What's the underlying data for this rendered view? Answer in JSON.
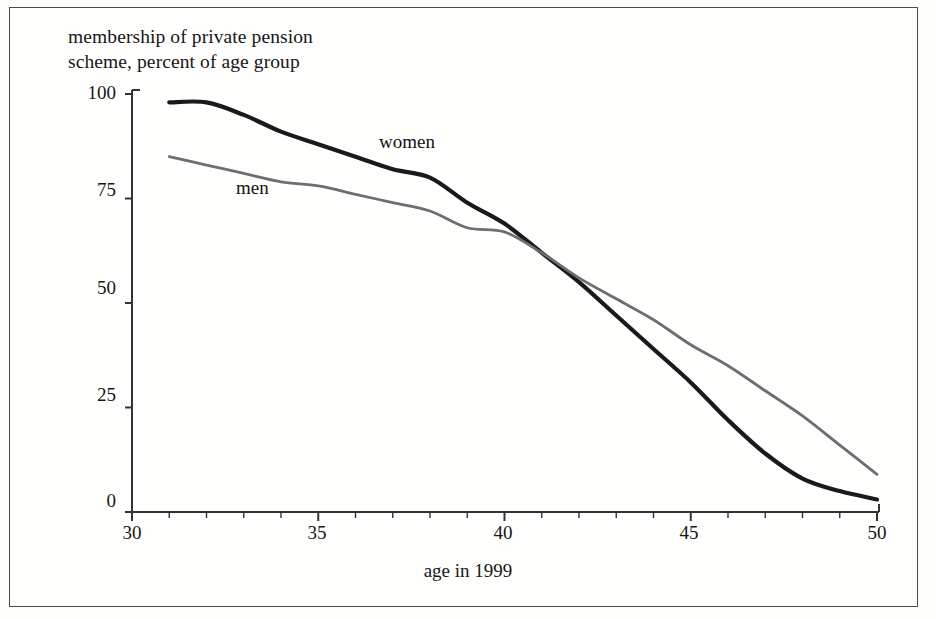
{
  "figure": {
    "ylabel_line1": "membership of private pension",
    "ylabel_line2": "scheme, percent of age group",
    "xlabel": "age in 1999",
    "frame_color": "#4a4a4a",
    "background": "#fffffe"
  },
  "chart_data": {
    "type": "line",
    "title": "",
    "subtitle": "",
    "xlabel": "age in 1999",
    "ylabel": "membership of private pension scheme, percent of age group",
    "xlim": [
      30,
      50
    ],
    "ylim": [
      0,
      100
    ],
    "xticks": [
      30,
      35,
      40,
      45,
      50
    ],
    "xtick_labels": [
      "30",
      "35",
      "40",
      "45",
      "50"
    ],
    "xminor_ticks": [
      31,
      32,
      33,
      34,
      36,
      37,
      38,
      39,
      41,
      42,
      43,
      44,
      46,
      47,
      48,
      49
    ],
    "yticks": [
      0,
      25,
      50,
      75,
      100
    ],
    "ytick_labels": [
      "0",
      "25",
      "50",
      "75",
      "100"
    ],
    "grid": false,
    "legend_position": "inline-annotations",
    "annotations": [
      {
        "text": "women",
        "x": 40.4,
        "y": 86,
        "series": "women"
      },
      {
        "text": "men",
        "x": 36.6,
        "y": 75,
        "series": "men"
      }
    ],
    "x": [
      31,
      32,
      33,
      34,
      35,
      36,
      37,
      38,
      39,
      40,
      41,
      42,
      43,
      44,
      45,
      46,
      47,
      48,
      49,
      50
    ],
    "series": [
      {
        "name": "women",
        "color": "#1a1a1a",
        "line_width": 4.2,
        "values": [
          98,
          98,
          95,
          91,
          88,
          85,
          82,
          80,
          74,
          69,
          62,
          55,
          47,
          39,
          31,
          22,
          14,
          8,
          5,
          3
        ]
      },
      {
        "name": "men",
        "color": "#6e6e6e",
        "line_width": 2.8,
        "values": [
          85,
          83,
          81,
          79,
          78,
          76,
          74,
          72,
          68,
          67,
          62,
          56,
          51,
          46,
          40,
          35,
          29,
          23,
          16,
          9
        ]
      }
    ]
  },
  "axis_labels": {
    "y": [
      {
        "value": "100",
        "top": 82
      },
      {
        "value": "75",
        "top": 179
      },
      {
        "value": "50",
        "top": 277
      },
      {
        "value": "25",
        "top": 384
      },
      {
        "value": "0",
        "top": 490
      }
    ],
    "x": [
      {
        "value": "30",
        "left": 102
      },
      {
        "value": "35",
        "left": 287
      },
      {
        "value": "40",
        "left": 473
      },
      {
        "value": "45",
        "left": 659
      },
      {
        "value": "50",
        "left": 847
      }
    ]
  },
  "series_labels": {
    "women": "women",
    "men": "men"
  }
}
